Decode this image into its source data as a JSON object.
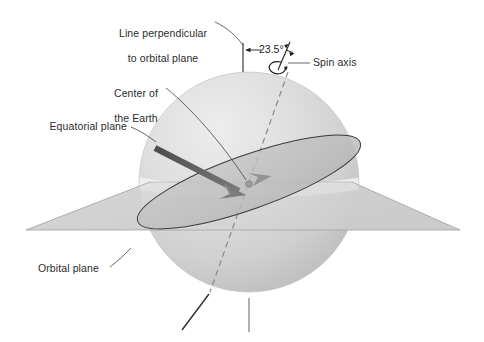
{
  "figure": {
    "labels": {
      "perpendicular_line_1": "Line perpendicular",
      "perpendicular_line_2": "to orbital plane",
      "center_earth_1": "Center of",
      "center_earth_2": "the Earth",
      "equatorial_plane": "Equatorial plane",
      "orbital_plane": "Orbital plane",
      "spin_axis": "Spin axis",
      "tilt_angle": "23.5°"
    },
    "colors": {
      "sphere_light": "#e3e3e3",
      "sphere_mid": "#cfcfcf",
      "sphere_dark": "#bdbdbd",
      "plane_fill": "#c9c9c9",
      "plane_edge": "#9a9a9a",
      "equator_band": "#efefef",
      "arrow_dark": "#6e6e6e",
      "arrow_darker": "#4f4f4f",
      "text": "#2b2b2b",
      "leader": "#4a4a4a",
      "axis_dash": "#8c8c8c",
      "background": "#ffffff"
    },
    "geometry": {
      "sphere_center_x": 249,
      "sphere_center_y": 182,
      "sphere_radius": 110,
      "tilt_degrees": 23.5
    }
  }
}
